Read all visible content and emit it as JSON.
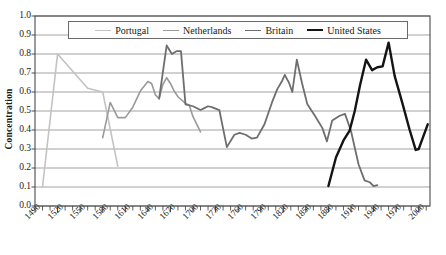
{
  "chart_data": {
    "type": "line",
    "title": "",
    "xlabel": "",
    "ylabel": "Concentration",
    "xlim": [
      1490,
      2015
    ],
    "ylim": [
      0.0,
      1.0
    ],
    "grid": true,
    "legend_position": "top-center",
    "y_ticks": [
      "0.0",
      "0.1",
      "0.2",
      "0.3",
      "0.4",
      "0.5",
      "0.6",
      "0.7",
      "0.8",
      "0.9",
      "1.0"
    ],
    "y_tick_values": [
      0.0,
      0.1,
      0.2,
      0.3,
      0.4,
      0.5,
      0.6,
      0.7,
      0.8,
      0.9,
      1.0
    ],
    "x_ticks": [
      "1490",
      "1520",
      "1550",
      "1580",
      "1610",
      "1640",
      "1670",
      "1700",
      "1730",
      "1760",
      "1790",
      "1820",
      "1850",
      "1880",
      "1910",
      "1940",
      "1970",
      "2000"
    ],
    "x_tick_values": [
      1490,
      1520,
      1550,
      1580,
      1610,
      1640,
      1670,
      1700,
      1730,
      1760,
      1790,
      1820,
      1850,
      1880,
      1910,
      1940,
      1970,
      2000
    ],
    "x_minor_tick_step": 10,
    "series": [
      {
        "name": "Portugal",
        "color": "#c3c3c3",
        "width": 1.6,
        "points": [
          [
            1500,
            0.1
          ],
          [
            1520,
            0.8
          ],
          [
            1560,
            0.62
          ],
          [
            1580,
            0.6
          ],
          [
            1600,
            0.21
          ]
        ]
      },
      {
        "name": "Netherlands",
        "color": "#9a9a9a",
        "width": 1.6,
        "points": [
          [
            1580,
            0.36
          ],
          [
            1590,
            0.545
          ],
          [
            1600,
            0.465
          ],
          [
            1610,
            0.465
          ],
          [
            1620,
            0.52
          ],
          [
            1630,
            0.605
          ],
          [
            1640,
            0.655
          ],
          [
            1645,
            0.645
          ],
          [
            1650,
            0.585
          ],
          [
            1655,
            0.565
          ],
          [
            1660,
            0.64
          ],
          [
            1665,
            0.675
          ],
          [
            1670,
            0.645
          ],
          [
            1675,
            0.605
          ],
          [
            1680,
            0.575
          ],
          [
            1690,
            0.54
          ],
          [
            1695,
            0.53
          ],
          [
            1700,
            0.47
          ],
          [
            1710,
            0.39
          ]
        ]
      },
      {
        "name": "Britain",
        "color": "#6e6e6e",
        "width": 1.8,
        "points": [
          [
            1655,
            0.565
          ],
          [
            1665,
            0.845
          ],
          [
            1672,
            0.8
          ],
          [
            1678,
            0.815
          ],
          [
            1684,
            0.815
          ],
          [
            1690,
            0.535
          ],
          [
            1700,
            0.525
          ],
          [
            1710,
            0.505
          ],
          [
            1715,
            0.515
          ],
          [
            1720,
            0.525
          ],
          [
            1725,
            0.52
          ],
          [
            1735,
            0.505
          ],
          [
            1745,
            0.31
          ],
          [
            1755,
            0.375
          ],
          [
            1762,
            0.385
          ],
          [
            1770,
            0.375
          ],
          [
            1778,
            0.355
          ],
          [
            1785,
            0.36
          ],
          [
            1795,
            0.43
          ],
          [
            1805,
            0.545
          ],
          [
            1812,
            0.615
          ],
          [
            1818,
            0.655
          ],
          [
            1822,
            0.69
          ],
          [
            1828,
            0.645
          ],
          [
            1832,
            0.6
          ],
          [
            1838,
            0.77
          ],
          [
            1845,
            0.645
          ],
          [
            1852,
            0.535
          ],
          [
            1862,
            0.475
          ],
          [
            1872,
            0.41
          ],
          [
            1878,
            0.34
          ],
          [
            1885,
            0.45
          ],
          [
            1895,
            0.475
          ],
          [
            1902,
            0.485
          ],
          [
            1910,
            0.395
          ],
          [
            1920,
            0.22
          ],
          [
            1928,
            0.135
          ],
          [
            1935,
            0.125
          ],
          [
            1940,
            0.105
          ],
          [
            1945,
            0.11
          ]
        ]
      },
      {
        "name": "United States",
        "color": "#141414",
        "width": 2.4,
        "points": [
          [
            1880,
            0.105
          ],
          [
            1890,
            0.255
          ],
          [
            1900,
            0.345
          ],
          [
            1908,
            0.395
          ],
          [
            1915,
            0.5
          ],
          [
            1922,
            0.635
          ],
          [
            1930,
            0.77
          ],
          [
            1938,
            0.715
          ],
          [
            1945,
            0.73
          ],
          [
            1952,
            0.735
          ],
          [
            1960,
            0.86
          ],
          [
            1968,
            0.685
          ],
          [
            1978,
            0.545
          ],
          [
            1988,
            0.4
          ],
          [
            1996,
            0.295
          ],
          [
            2000,
            0.3
          ],
          [
            2006,
            0.365
          ],
          [
            2012,
            0.43
          ]
        ]
      }
    ]
  },
  "legend": {
    "items": [
      {
        "label": "Portugal"
      },
      {
        "label": "Netherlands"
      },
      {
        "label": "Britain"
      },
      {
        "label": "United States"
      }
    ]
  }
}
